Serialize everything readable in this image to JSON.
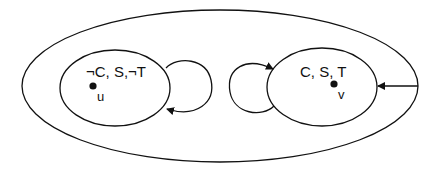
{
  "diagram": {
    "outer_region": {
      "label": ""
    },
    "states": [
      {
        "id": "left",
        "label": "¬C, S,¬T",
        "point_label": "u"
      },
      {
        "id": "right",
        "label": "C, S, T",
        "point_label": "v"
      }
    ],
    "edges": [
      {
        "from": "left",
        "to": "left",
        "type": "self-loop"
      },
      {
        "from": "right",
        "to": "right",
        "type": "self-loop"
      },
      {
        "from": "outer",
        "to": "right",
        "type": "arrow"
      }
    ],
    "colors": {
      "stroke": "#111111",
      "background": "#ffffff"
    }
  }
}
